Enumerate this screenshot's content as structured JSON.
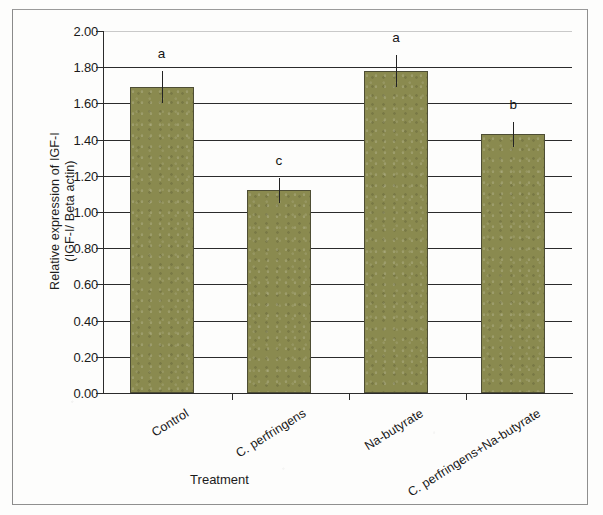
{
  "figure": {
    "background_color": "#fdfdfc",
    "bar_color": "#8a8a4f",
    "bar_edge_color": "#4d4d34",
    "axis_color": "#2b2b2b"
  },
  "chart_data": {
    "type": "bar",
    "title": "",
    "xlabel": "Treatment",
    "ylabel_line1": "Relative expression of IGF-I",
    "ylabel_line2": "(IGF-I/ Beta actin)",
    "categories": [
      "Control",
      "C. perfringens",
      "Na-butyrate",
      "C. perfringens+Na-butyrate"
    ],
    "values": [
      1.69,
      1.12,
      1.78,
      1.43
    ],
    "errors": [
      0.09,
      0.07,
      0.09,
      0.07
    ],
    "annotations": [
      "a",
      "c",
      "a",
      "b"
    ],
    "ylim": [
      0.0,
      2.0
    ],
    "ytick_labels": [
      "0.00",
      "0.20",
      "0.40",
      "0.60",
      "0.80",
      "1.00",
      "1.20",
      "1.40",
      "1.60",
      "1.80",
      "2.00"
    ],
    "ytick_values": [
      0.0,
      0.2,
      0.4,
      0.6,
      0.8,
      1.0,
      1.2,
      1.4,
      1.6,
      1.8,
      2.0
    ],
    "grid": true,
    "legend": "none",
    "error_bar_style": "line-no-cap"
  }
}
